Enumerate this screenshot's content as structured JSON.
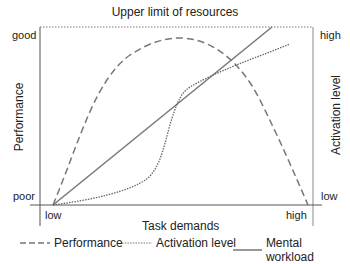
{
  "diagram": {
    "title": "Upper limit of resources",
    "x_axis": {
      "label": "Task demands",
      "tick_low": "low",
      "tick_high": "high"
    },
    "left_axis": {
      "label": "Performance",
      "tick_top": "good",
      "tick_bottom": "poor"
    },
    "right_axis": {
      "label": "Activation level",
      "tick_top": "high",
      "tick_bottom": "low"
    },
    "curves": [
      {
        "name": "Performance",
        "style": "dashed",
        "shape": "inverted-U"
      },
      {
        "name": "Activation level",
        "style": "dotted",
        "shape": "sigmoid"
      },
      {
        "name": "Mental workload",
        "style": "solid",
        "shape": "linear"
      }
    ],
    "colors": {
      "line": "#777777",
      "axis": "#555555",
      "text": "#222222"
    }
  },
  "legend": {
    "items": [
      {
        "label": "Performance",
        "style": "dashed"
      },
      {
        "label": "Activation level",
        "style": "dotted"
      },
      {
        "label": "Mental workload",
        "style": "solid"
      }
    ]
  }
}
